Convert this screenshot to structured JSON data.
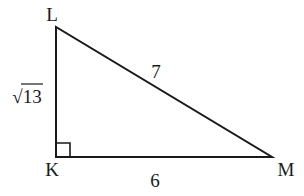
{
  "diagram": {
    "type": "right-triangle",
    "vertices": {
      "L": {
        "label": "L",
        "x": 56,
        "y": 27
      },
      "K": {
        "label": "K",
        "x": 56,
        "y": 157
      },
      "M": {
        "label": "M",
        "x": 272,
        "y": 157
      }
    },
    "sides": {
      "LK": {
        "label": "√13"
      },
      "LM": {
        "label": "7"
      },
      "KM": {
        "label": "6"
      }
    },
    "right_angle_at": "K",
    "colors": {
      "stroke": "#1a1a1a",
      "background": "#ffffff"
    }
  }
}
